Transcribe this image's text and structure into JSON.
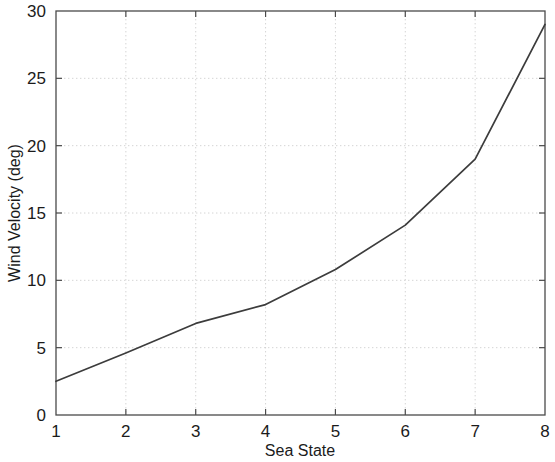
{
  "chart_data": {
    "type": "line",
    "title": "",
    "xlabel": "Sea State",
    "ylabel": "Wind Velocity (deg)",
    "x": [
      1,
      2,
      3,
      4,
      5,
      6,
      7,
      8
    ],
    "values": [
      2.5,
      4.6,
      6.8,
      8.2,
      10.8,
      14.1,
      19.0,
      29.0
    ],
    "series": [
      {
        "name": "Wind Velocity",
        "values": [
          2.5,
          4.6,
          6.8,
          8.2,
          10.8,
          14.1,
          19.0,
          29.0
        ],
        "color": "#3c3c3c"
      }
    ],
    "xlim": [
      1,
      8
    ],
    "ylim": [
      0,
      30
    ],
    "xticks": [
      1,
      2,
      3,
      4,
      5,
      6,
      7,
      8
    ],
    "yticks": [
      0,
      5,
      10,
      15,
      20,
      25,
      30
    ],
    "xticklabels": [
      "1",
      "2",
      "3",
      "4",
      "5",
      "6",
      "7",
      "8"
    ],
    "yticklabels": [
      "0",
      "5",
      "10",
      "15",
      "20",
      "25",
      "30"
    ],
    "grid": true,
    "legend": false,
    "legend_position": "none"
  },
  "axes": {
    "x_title": "Sea State",
    "y_title": "Wind Velocity (deg)"
  }
}
